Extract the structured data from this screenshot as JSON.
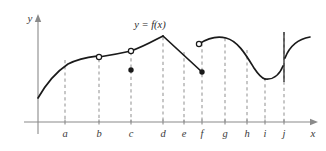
{
  "figure": {
    "kind": "math-graph",
    "background_color": "#ffffff",
    "curve_color": "#1a1a1a",
    "axis_color": "#8a8a8a",
    "dashed_color": "#9a9a9a",
    "label_color": "#3a3a3a"
  },
  "axes": {
    "y_label": "y",
    "x_label": "x",
    "origin": {
      "x": 38,
      "y": 122
    },
    "x_axis_end": 318,
    "y_axis_top": 14
  },
  "function_label": {
    "text": "y = f(x)",
    "x": 150,
    "y": 28
  },
  "ticks": [
    {
      "label": "a",
      "x": 65
    },
    {
      "label": "b",
      "x": 99
    },
    {
      "label": "c",
      "x": 131
    },
    {
      "label": "d",
      "x": 163
    },
    {
      "label": "e",
      "x": 184
    },
    {
      "label": "f",
      "x": 202
    },
    {
      "label": "g",
      "x": 225
    },
    {
      "label": "h",
      "x": 247
    },
    {
      "label": "i",
      "x": 265
    },
    {
      "label": "j",
      "x": 284
    }
  ],
  "tick_label_y": 137,
  "dashed_lines": [
    {
      "name": "a",
      "x": 65,
      "y_top": 60,
      "y_bottom": 122
    },
    {
      "name": "b",
      "x": 99,
      "y_top": 59,
      "y_bottom": 122
    },
    {
      "name": "c",
      "x": 131,
      "y_top": 52,
      "y_bottom": 122
    },
    {
      "name": "d",
      "x": 163,
      "y_top": 37,
      "y_bottom": 122
    },
    {
      "name": "e",
      "x": 184,
      "y_top": 52,
      "y_bottom": 122
    },
    {
      "name": "f",
      "x": 202,
      "y_top": 43,
      "y_bottom": 122
    },
    {
      "name": "g",
      "x": 225,
      "y_top": 38,
      "y_bottom": 122
    },
    {
      "name": "h",
      "x": 247,
      "y_top": 50,
      "y_bottom": 122
    },
    {
      "name": "i",
      "x": 265,
      "y_top": 78,
      "y_bottom": 122
    },
    {
      "name": "j",
      "x": 284,
      "y_top": 32,
      "y_bottom": 122
    }
  ],
  "vertical_line": {
    "name": "asymptote-at-j",
    "x": 284,
    "y_top": 32,
    "y_bottom": 82
  },
  "branches": [
    {
      "name": "branch-start-to-b",
      "path": "M 38,98 C 46,84 56,72 68,64 C 80,58 90,57 98,56"
    },
    {
      "name": "branch-b-to-d",
      "path": "M 99,57 C 112,55 122,53 131,51 C 145,46 155,40 163,36"
    },
    {
      "name": "branch-d-to-f",
      "path": "M 163,36 L 202,72"
    },
    {
      "name": "branch-f-to-i",
      "path": "M 199,44 C 208,38 218,36 226,38 C 238,41 246,55 254,68 C 258,74 261,78 265,79"
    },
    {
      "name": "branch-i-to-j",
      "path": "M 265,79 C 272,80 279,76 283,66"
    },
    {
      "name": "branch-after-j",
      "path": "M 285,58 C 290,45 298,39 310,37"
    }
  ],
  "open_points": [
    {
      "name": "open-point-b",
      "x": 99,
      "y": 57
    },
    {
      "name": "open-point-c",
      "x": 131,
      "y": 51
    },
    {
      "name": "open-point-f-right",
      "x": 199,
      "y": 44
    }
  ],
  "closed_points": [
    {
      "name": "closed-point-c",
      "x": 131,
      "y": 70
    },
    {
      "name": "closed-point-f",
      "x": 202,
      "y": 72
    }
  ]
}
